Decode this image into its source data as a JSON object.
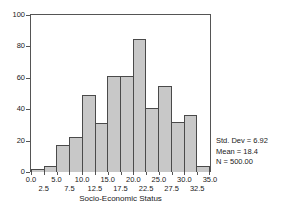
{
  "chart_data": {
    "type": "bar",
    "title": "",
    "subtitle": "",
    "xlabel": "Socio-Economic Status",
    "ylabel": "",
    "xlim": [
      0.0,
      35.0
    ],
    "ylim": [
      0,
      100
    ],
    "grid": false,
    "legend": null,
    "bin_width": 2.5,
    "bin_starts": [
      0.0,
      2.5,
      5.0,
      7.5,
      10.0,
      12.5,
      15.0,
      17.5,
      20.0,
      22.5,
      25.0,
      27.5,
      30.0,
      32.5
    ],
    "categories": [
      "0.0-2.5",
      "2.5-5.0",
      "5.0-7.5",
      "7.5-10.0",
      "10.0-12.5",
      "12.5-15.0",
      "15.0-17.5",
      "17.5-20.0",
      "20.0-22.5",
      "22.5-25.0",
      "25.0-27.5",
      "27.5-30.0",
      "30.0-32.5",
      "32.5-35.0"
    ],
    "values": [
      2,
      4,
      17,
      22,
      49,
      31,
      61,
      61,
      85,
      41,
      55,
      32,
      36,
      4
    ],
    "y_ticks": [
      0,
      20,
      40,
      60,
      80,
      100
    ],
    "y_tick_labels": [
      "0",
      "20",
      "40",
      "60",
      "80",
      "100"
    ],
    "x_ticks": [
      0.0,
      2.5,
      5.0,
      7.5,
      10.0,
      12.5,
      15.0,
      17.5,
      20.0,
      22.5,
      25.0,
      27.5,
      30.0,
      32.5,
      35.0
    ],
    "x_tick_labels_row0": [
      {
        "value": 0.0,
        "label": "0.0"
      },
      {
        "value": 5.0,
        "label": "5.0"
      },
      {
        "value": 10.0,
        "label": "10.0"
      },
      {
        "value": 15.0,
        "label": "15.0"
      },
      {
        "value": 20.0,
        "label": "20.0"
      },
      {
        "value": 25.0,
        "label": "25.0"
      },
      {
        "value": 30.0,
        "label": "30.0"
      },
      {
        "value": 35.0,
        "label": "35.0"
      }
    ],
    "x_tick_labels_row1": [
      {
        "value": 2.5,
        "label": "2.5"
      },
      {
        "value": 7.5,
        "label": "7.5"
      },
      {
        "value": 12.5,
        "label": "12.5"
      },
      {
        "value": 17.5,
        "label": "17.5"
      },
      {
        "value": 22.5,
        "label": "22.5"
      },
      {
        "value": 27.5,
        "label": "27.5"
      },
      {
        "value": 32.5,
        "label": "32.5"
      }
    ],
    "annotations": {
      "std_dev": "Std. Dev = 6.92",
      "mean": "Mean = 18.4",
      "n": "N = 500.00"
    },
    "colors": {
      "bar_fill": "#c8c8c8",
      "bar_border": "#4a4a4a",
      "axis": "#555555",
      "text": "#1a1a1a",
      "background": "#ffffff"
    }
  }
}
